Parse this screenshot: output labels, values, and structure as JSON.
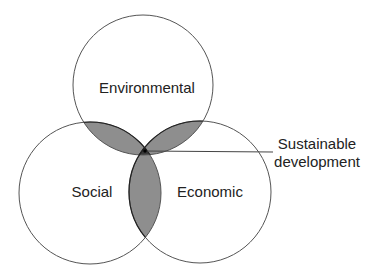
{
  "diagram": {
    "type": "venn",
    "circles": [
      {
        "id": "environmental",
        "label": "Environmental"
      },
      {
        "id": "social",
        "label": "Social"
      },
      {
        "id": "economic",
        "label": "Economic"
      }
    ],
    "center_callout": {
      "line1": "Sustainable",
      "line2": "development"
    },
    "colors": {
      "pairwise_overlap": "#8e8e8e",
      "triple_overlap": "#383838",
      "outline": "#555555"
    }
  }
}
